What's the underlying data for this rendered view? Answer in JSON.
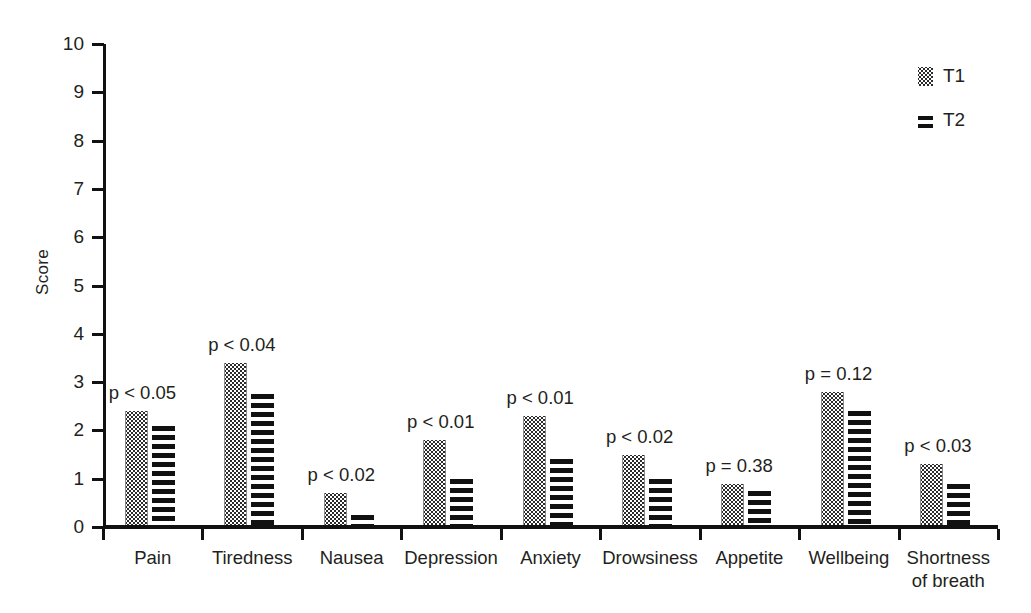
{
  "chart_data": {
    "type": "bar",
    "title": "",
    "subtitle": "",
    "xlabel": "",
    "ylabel": "Score",
    "ylim": [
      0,
      10
    ],
    "ytick_labels": [
      "0",
      "1",
      "2",
      "3",
      "4",
      "5",
      "6",
      "7",
      "8",
      "9",
      "10"
    ],
    "ytick_values": [
      0,
      1,
      2,
      3,
      4,
      5,
      6,
      7,
      8,
      9,
      10
    ],
    "grid": false,
    "legend_position": "top-right",
    "categories": [
      "Pain",
      "Tiredness",
      "Nausea",
      "Depression",
      "Anxiety",
      "Drowsiness",
      "Appetite",
      "Wellbeing",
      "Shortness of breath"
    ],
    "series": [
      {
        "name": "T1",
        "pattern": "dotted",
        "values": [
          2.4,
          3.4,
          0.7,
          1.8,
          2.3,
          1.5,
          0.9,
          2.8,
          1.3
        ]
      },
      {
        "name": "T2",
        "pattern": "horizontal-stripes",
        "values": [
          2.1,
          2.75,
          0.25,
          1.0,
          1.4,
          1.0,
          0.75,
          2.4,
          0.9
        ]
      }
    ],
    "annotations": [
      {
        "category": "Pain",
        "text": "p < 0.05"
      },
      {
        "category": "Tiredness",
        "text": "p < 0.04"
      },
      {
        "category": "Nausea",
        "text": "p < 0.02"
      },
      {
        "category": "Depression",
        "text": "p < 0.01"
      },
      {
        "category": "Anxiety",
        "text": "p < 0.01"
      },
      {
        "category": "Drowsiness",
        "text": "p < 0.02"
      },
      {
        "category": "Appetite",
        "text": "p = 0.38"
      },
      {
        "category": "Wellbeing",
        "text": "p = 0.12"
      },
      {
        "category": "Shortness of breath",
        "text": "p < 0.03"
      }
    ],
    "colors": {
      "axis": "#111111",
      "text": "#231f20",
      "t1_fill": "#ffffff",
      "t1_dots": "#2b2b2b",
      "t2_stripes": "#111111",
      "background": "#ffffff"
    }
  },
  "legend": {
    "items": [
      {
        "label": "T1",
        "swatch": "dotted-swatch-icon"
      },
      {
        "label": "T2",
        "swatch": "striped-swatch-icon"
      }
    ]
  },
  "axis": {
    "y_title": "Score"
  },
  "x_labels": [
    {
      "line1": "Pain",
      "line2": ""
    },
    {
      "line1": "Tiredness",
      "line2": ""
    },
    {
      "line1": "Nausea",
      "line2": ""
    },
    {
      "line1": "Depression",
      "line2": ""
    },
    {
      "line1": "Anxiety",
      "line2": ""
    },
    {
      "line1": "Drowsiness",
      "line2": ""
    },
    {
      "line1": "Appetite",
      "line2": ""
    },
    {
      "line1": "Wellbeing",
      "line2": ""
    },
    {
      "line1": "Shortness",
      "line2": "of breath"
    }
  ]
}
